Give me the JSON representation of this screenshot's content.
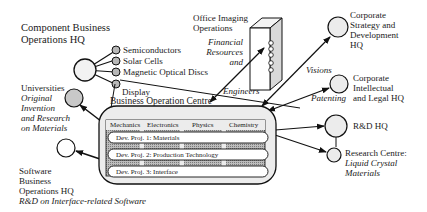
{
  "component_hq": {
    "title_line1": "Component Business",
    "title_line2": "Operations HQ",
    "products": [
      "Semiconductors",
      "Solar Cells",
      "Magnetic Optical Discs",
      "Display"
    ]
  },
  "office_imaging": {
    "title_line1": "Office Imaging",
    "title_line2": "Operations",
    "flow_line1": "Financial",
    "flow_line2": "Resources",
    "flow_line3": "and",
    "flow_engineers": "Engineers"
  },
  "corporate_strategy": {
    "line1": "Corporate",
    "line2": "Strategy and",
    "line3": "Development",
    "line4": "HQ",
    "flow": "Visions"
  },
  "corporate_legal": {
    "line1": "Corporate",
    "line2": "Intellectual",
    "line3": "and Legal HQ",
    "flow": "Patenting"
  },
  "rd_hq": {
    "label": "R&D HQ"
  },
  "research_centre": {
    "line1": "Research Centre:",
    "line2": "Liquid Crystal",
    "line3": "Materials"
  },
  "universities": {
    "title": "Universities",
    "line1": "Original",
    "line2": "Invention",
    "line3": "and Research",
    "line4": "on Materials"
  },
  "software_hq": {
    "line1": "Software",
    "line2": "Business",
    "line3": "Operations HQ",
    "line4": "R&D on Interface-related Software"
  },
  "business_centre": {
    "title": "Business Operation Centre",
    "disciplines": [
      "Mechanics",
      "Electronics",
      "Physics",
      "Chemistry"
    ],
    "projects": [
      "Dev. Proj. 1: Materials",
      "Dev. Proj. 2: Production Technology",
      "Dev. Proj. 3: Interface"
    ]
  }
}
